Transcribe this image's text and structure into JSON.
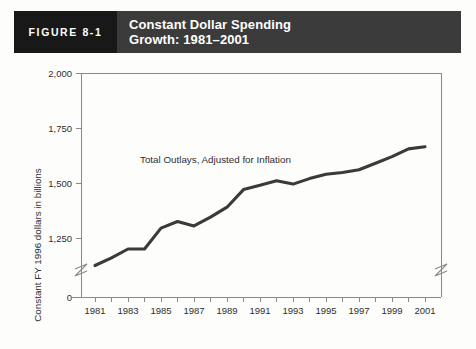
{
  "header": {
    "figure_tag": "FIGURE 8-1",
    "title_line1": "Constant Dollar Spending",
    "title_line2": "Growth: 1981–2001",
    "tag_bg": "#181818",
    "banner_bg": "#3b3b3b",
    "text_color": "#ffffff"
  },
  "chart_data": {
    "type": "line",
    "title": "Constant Dollar Spending Growth: 1981–2001",
    "xlabel": "",
    "ylabel": "Constant FY 1996 dollars in billions",
    "annotation": "Total Outlays, Adjusted for Inflation",
    "grid": false,
    "legend": "none",
    "line_color": "#3a3a3a",
    "axis_color": "#8a8a8a",
    "ylim": [
      1000,
      2000
    ],
    "y_axis_break": true,
    "y_zero_label": "0",
    "y_ticks": [
      1250,
      1500,
      1750,
      2000
    ],
    "y_tick_labels": [
      "1,250",
      "1,500",
      "1,750",
      "2,000"
    ],
    "x": [
      1981,
      1982,
      1983,
      1984,
      1985,
      1986,
      1987,
      1988,
      1989,
      1990,
      1991,
      1992,
      1993,
      1994,
      1995,
      1996,
      1997,
      1998,
      1999,
      2000,
      2001
    ],
    "x_tick_labels": [
      "1981",
      "1983",
      "1985",
      "1987",
      "1989",
      "1991",
      "1993",
      "1995",
      "1997",
      "1999",
      "2001"
    ],
    "x_labeled_years": [
      1981,
      1983,
      1985,
      1987,
      1989,
      1991,
      1993,
      1995,
      1997,
      1999,
      2001
    ],
    "series": [
      {
        "name": "Total Outlays, Adjusted for Inflation",
        "values": [
          1125,
          1160,
          1200,
          1200,
          1295,
          1325,
          1305,
          1345,
          1390,
          1470,
          1490,
          1510,
          1495,
          1520,
          1540,
          1548,
          1560,
          1590,
          1620,
          1655,
          1665
        ]
      }
    ]
  }
}
